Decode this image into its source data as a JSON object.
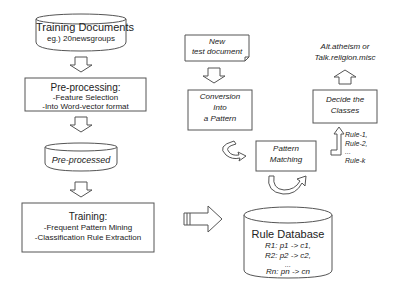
{
  "training_docs": {
    "title": "Training Documents",
    "subtitle": "eg.) 20newsgroups"
  },
  "preprocessing": {
    "title": "Pre-processing:",
    "lines": [
      "-Feature Selection",
      "-Into Word-vector format"
    ]
  },
  "preprocessed": {
    "label": "Pre-processed"
  },
  "training": {
    "title": "Training:",
    "lines": [
      "-Frequent Pattern Mining",
      "-Classification Rule Extraction"
    ]
  },
  "new_doc": {
    "lines": [
      "New",
      "test document"
    ]
  },
  "conversion": {
    "lines": [
      "Conversion",
      "Into",
      "a Pattern"
    ]
  },
  "pattern_matching": {
    "lines": [
      "Pattern",
      "Matching"
    ]
  },
  "rule_db": {
    "title": "Rule Database",
    "rules": [
      "R1: p1 -> c1,",
      "R2: p2 -> c2,",
      "...",
      "Rn: pn -> cn"
    ]
  },
  "rules_out": {
    "lines": [
      "Rule-1,",
      "Rule-2,",
      "...",
      "Rule-k"
    ]
  },
  "decide": {
    "lines": [
      "Decide the",
      "Classes"
    ]
  },
  "classes": {
    "lines": [
      "Alt.atheism  or",
      "Talk.religion.misc"
    ]
  },
  "colors": {
    "stroke": "#555555",
    "text": "#222222",
    "background": "#ffffff"
  }
}
